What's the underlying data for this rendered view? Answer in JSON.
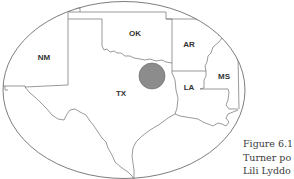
{
  "map": {
    "region": "South-central United States",
    "states": [
      {
        "id": "NM",
        "label": "NM",
        "x": 44,
        "y": 60
      },
      {
        "id": "OK",
        "label": "OK",
        "x": 135,
        "y": 36
      },
      {
        "id": "AR",
        "label": "AR",
        "x": 189,
        "y": 47
      },
      {
        "id": "TX",
        "label": "TX",
        "x": 121,
        "y": 96
      },
      {
        "id": "LA",
        "label": "LA",
        "x": 189,
        "y": 90
      },
      {
        "id": "MS",
        "label": "MS",
        "x": 224,
        "y": 79
      }
    ],
    "marker": {
      "cx": 152,
      "cy": 76,
      "r": 13,
      "fill": "#8c8c8c",
      "stroke": "#6e6e6e"
    },
    "colors": {
      "border": "#6f6f6f",
      "ellipse": "#5c5c5c",
      "label": "#333333"
    }
  },
  "caption": {
    "lines": [
      "Figure 6.1",
      "Turner po",
      "Lili Lyddo"
    ]
  }
}
